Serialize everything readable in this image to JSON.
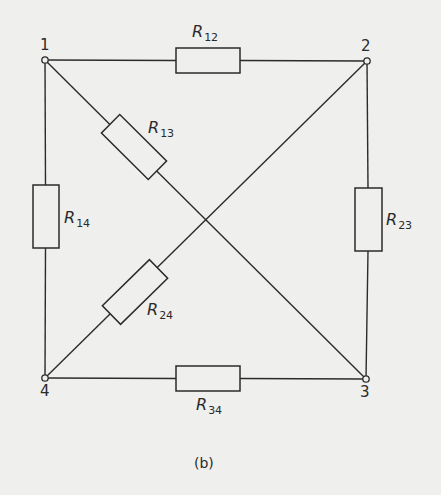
{
  "diagram": {
    "type": "resistor-network",
    "caption": "(b)",
    "nodes": [
      {
        "id": "1",
        "label": "1"
      },
      {
        "id": "2",
        "label": "2"
      },
      {
        "id": "3",
        "label": "3"
      },
      {
        "id": "4",
        "label": "4"
      }
    ],
    "resistors": [
      {
        "id": "R12",
        "symbol": "R",
        "subscript": "12",
        "from": "1",
        "to": "2"
      },
      {
        "id": "R13",
        "symbol": "R",
        "subscript": "13",
        "from": "1",
        "to": "3"
      },
      {
        "id": "R14",
        "symbol": "R",
        "subscript": "14",
        "from": "1",
        "to": "4"
      },
      {
        "id": "R23",
        "symbol": "R",
        "subscript": "23",
        "from": "2",
        "to": "3"
      },
      {
        "id": "R24",
        "symbol": "R",
        "subscript": "24",
        "from": "2",
        "to": "4"
      },
      {
        "id": "R34",
        "symbol": "R",
        "subscript": "34",
        "from": "3",
        "to": "4"
      }
    ]
  }
}
